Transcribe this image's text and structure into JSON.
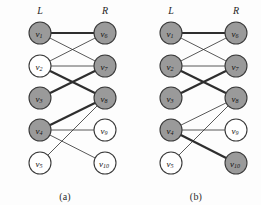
{
  "figure": {
    "type": "bipartite-graph-pair",
    "width": 261,
    "height": 205,
    "background_color": "#fdfdfd"
  },
  "style": {
    "node_shaded_fill": "#9a9a9a",
    "node_empty_fill": "#ffffff",
    "node_stroke": "#3a3a3a",
    "node_radius": 11,
    "edge_color": "#2e2e2e",
    "edge_thin_width": 0.8,
    "edge_thick_width": 2.2
  },
  "geometry": {
    "left_x": 40,
    "right_x": 105,
    "rows_y": [
      33,
      66,
      98,
      130,
      163
    ],
    "label_y": 14
  },
  "panels": [
    {
      "id": "a",
      "caption": "(a)",
      "side_labels": {
        "left": "L",
        "right": "R"
      },
      "nodes": [
        {
          "id": "v1",
          "label": "v",
          "sub": "1",
          "side": "left",
          "row": 0,
          "shaded": true
        },
        {
          "id": "v2",
          "label": "v",
          "sub": "2",
          "side": "left",
          "row": 1,
          "shaded": false
        },
        {
          "id": "v3",
          "label": "v",
          "sub": "3",
          "side": "left",
          "row": 2,
          "shaded": true
        },
        {
          "id": "v4",
          "label": "v",
          "sub": "4",
          "side": "left",
          "row": 3,
          "shaded": true
        },
        {
          "id": "v5",
          "label": "v",
          "sub": "5",
          "side": "left",
          "row": 4,
          "shaded": false
        },
        {
          "id": "v6",
          "label": "v",
          "sub": "6",
          "side": "right",
          "row": 0,
          "shaded": true
        },
        {
          "id": "v7",
          "label": "v",
          "sub": "7",
          "side": "right",
          "row": 1,
          "shaded": true
        },
        {
          "id": "v8",
          "label": "v",
          "sub": "8",
          "side": "right",
          "row": 2,
          "shaded": true
        },
        {
          "id": "v9",
          "label": "v",
          "sub": "9",
          "side": "right",
          "row": 3,
          "shaded": false
        },
        {
          "id": "v10",
          "label": "v",
          "sub": "10",
          "side": "right",
          "row": 4,
          "shaded": false
        }
      ],
      "edges": [
        {
          "from": "v1",
          "to": "v6",
          "thick": true
        },
        {
          "from": "v1",
          "to": "v7",
          "thick": false
        },
        {
          "from": "v2",
          "to": "v6",
          "thick": false
        },
        {
          "from": "v2",
          "to": "v7",
          "thick": false
        },
        {
          "from": "v2",
          "to": "v8",
          "thick": true
        },
        {
          "from": "v3",
          "to": "v7",
          "thick": true
        },
        {
          "from": "v4",
          "to": "v8",
          "thick": true
        },
        {
          "from": "v4",
          "to": "v9",
          "thick": false
        },
        {
          "from": "v4",
          "to": "v10",
          "thick": false
        },
        {
          "from": "v5",
          "to": "v8",
          "thick": false
        }
      ]
    },
    {
      "id": "b",
      "caption": "(b)",
      "side_labels": {
        "left": "L",
        "right": "R"
      },
      "nodes": [
        {
          "id": "v1",
          "label": "v",
          "sub": "1",
          "side": "left",
          "row": 0,
          "shaded": true
        },
        {
          "id": "v2",
          "label": "v",
          "sub": "2",
          "side": "left",
          "row": 1,
          "shaded": true
        },
        {
          "id": "v3",
          "label": "v",
          "sub": "3",
          "side": "left",
          "row": 2,
          "shaded": true
        },
        {
          "id": "v4",
          "label": "v",
          "sub": "4",
          "side": "left",
          "row": 3,
          "shaded": true
        },
        {
          "id": "v5",
          "label": "v",
          "sub": "5",
          "side": "left",
          "row": 4,
          "shaded": false
        },
        {
          "id": "v6",
          "label": "v",
          "sub": "6",
          "side": "right",
          "row": 0,
          "shaded": true
        },
        {
          "id": "v7",
          "label": "v",
          "sub": "7",
          "side": "right",
          "row": 1,
          "shaded": true
        },
        {
          "id": "v8",
          "label": "v",
          "sub": "8",
          "side": "right",
          "row": 2,
          "shaded": true
        },
        {
          "id": "v9",
          "label": "v",
          "sub": "9",
          "side": "right",
          "row": 3,
          "shaded": false
        },
        {
          "id": "v10",
          "label": "v",
          "sub": "10",
          "side": "right",
          "row": 4,
          "shaded": true
        }
      ],
      "edges": [
        {
          "from": "v1",
          "to": "v6",
          "thick": true
        },
        {
          "from": "v1",
          "to": "v7",
          "thick": false
        },
        {
          "from": "v2",
          "to": "v6",
          "thick": false
        },
        {
          "from": "v2",
          "to": "v7",
          "thick": false
        },
        {
          "from": "v2",
          "to": "v8",
          "thick": true
        },
        {
          "from": "v3",
          "to": "v7",
          "thick": true
        },
        {
          "from": "v4",
          "to": "v8",
          "thick": false
        },
        {
          "from": "v4",
          "to": "v9",
          "thick": false
        },
        {
          "from": "v4",
          "to": "v10",
          "thick": true
        },
        {
          "from": "v5",
          "to": "v8",
          "thick": false
        }
      ]
    }
  ]
}
